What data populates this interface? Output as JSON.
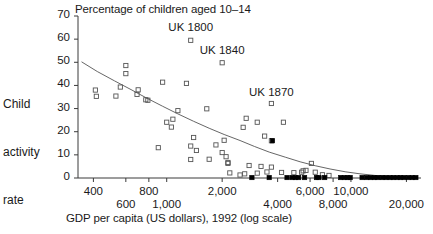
{
  "chart_data": {
    "type": "scatter",
    "title": "Percentage of children aged 10–14",
    "xlabel": "GDP per capita (US dollars), 1992 (log scale)",
    "ylabel": "Child activity rate",
    "ylabel_lines": [
      "Child",
      "activity",
      "rate"
    ],
    "xscale": "log",
    "xlim": [
      330,
      24000
    ],
    "ylim": [
      0,
      70
    ],
    "grid": false,
    "legend": "none",
    "yticks": [
      0,
      10,
      20,
      30,
      40,
      50,
      60,
      70
    ],
    "ytick_labels": [
      "0",
      "10",
      "20",
      "30",
      "40",
      "50",
      "60",
      "70"
    ],
    "xticks": [
      400,
      600,
      800,
      1000,
      2000,
      4000,
      6000,
      8000,
      10000,
      20000
    ],
    "xtick_labels_row1": [
      {
        "value": 400,
        "label": "400"
      },
      {
        "value": 800,
        "label": "800"
      },
      {
        "value": 2000,
        "label": "2,000"
      },
      {
        "value": 6000,
        "label": "6,000"
      },
      {
        "value": 10000,
        "label": "10,000"
      }
    ],
    "xtick_labels_row2": [
      {
        "value": 600,
        "label": "600"
      },
      {
        "value": 1000,
        "label": "1,000"
      },
      {
        "value": 4000,
        "label": "4,000"
      },
      {
        "value": 8000,
        "label": "8,000"
      },
      {
        "value": 20000,
        "label": "20,000"
      }
    ],
    "annotations": [
      {
        "text": "UK 1800",
        "x": 1350,
        "y": 64.5
      },
      {
        "text": "UK 1840",
        "x": 2000,
        "y": 54.5
      },
      {
        "text": "UK 1870",
        "x": 3700,
        "y": 36.5
      }
    ],
    "series": [
      {
        "name": "Developing countries",
        "marker": "open-square",
        "color": "#555555",
        "points": [
          [
            1350,
            59.5
          ],
          [
            2000,
            49.8
          ],
          [
            3700,
            32.2
          ],
          [
            600,
            48.6
          ],
          [
            600,
            45.1
          ],
          [
            560,
            39.3
          ],
          [
            410,
            38.0
          ],
          [
            700,
            38.1
          ],
          [
            415,
            35.3
          ],
          [
            530,
            35.4
          ],
          [
            690,
            36.1
          ],
          [
            770,
            33.8
          ],
          [
            790,
            33.6
          ],
          [
            950,
            41.4
          ],
          [
            1280,
            40.9
          ],
          [
            1150,
            29.1
          ],
          [
            1650,
            29.9
          ],
          [
            1000,
            24.1
          ],
          [
            1080,
            25.4
          ],
          [
            1060,
            22.0
          ],
          [
            2700,
            25.8
          ],
          [
            3100,
            24.1
          ],
          [
            4300,
            24.1
          ],
          [
            3400,
            18.1
          ],
          [
            3700,
            16.1
          ],
          [
            2050,
            16.3
          ],
          [
            2600,
            21.9
          ],
          [
            1400,
            17.5
          ],
          [
            1850,
            14.3
          ],
          [
            1350,
            13.8
          ],
          [
            2000,
            11.0
          ],
          [
            2100,
            9.2
          ],
          [
            2150,
            6.7
          ],
          [
            2150,
            6.3
          ],
          [
            900,
            13.1
          ],
          [
            1450,
            11.9
          ],
          [
            1350,
            8.0
          ],
          [
            1700,
            8.1
          ],
          [
            2200,
            2.2
          ],
          [
            2500,
            1.3
          ],
          [
            2650,
            1.8
          ],
          [
            2800,
            5.4
          ],
          [
            3250,
            5.0
          ],
          [
            3700,
            4.7
          ],
          [
            3100,
            2.1
          ],
          [
            3500,
            2.6
          ],
          [
            4200,
            2.4
          ],
          [
            4900,
            2.3
          ],
          [
            5400,
            2.5
          ],
          [
            5500,
            3.1
          ],
          [
            5700,
            3.3
          ],
          [
            6100,
            6.3
          ],
          [
            6400,
            2.5
          ],
          [
            7000,
            1.4
          ],
          [
            7600,
            1.1
          ]
        ]
      },
      {
        "name": "Industrialized countries",
        "marker": "filled-square",
        "color": "#000000",
        "points": [
          [
            3750,
            16.1
          ],
          [
            2900,
            0.2
          ],
          [
            3600,
            0.2
          ],
          [
            4500,
            0.2
          ],
          [
            4800,
            0.2
          ],
          [
            5000,
            0.2
          ],
          [
            5200,
            0.2
          ],
          [
            5600,
            0.2
          ],
          [
            6500,
            0.2
          ],
          [
            6700,
            0.2
          ],
          [
            7200,
            0.2
          ],
          [
            8800,
            0.2
          ],
          [
            9200,
            0.2
          ],
          [
            9600,
            0.2
          ],
          [
            9900,
            0.2
          ],
          [
            11500,
            0.2
          ],
          [
            12200,
            0.2
          ],
          [
            12800,
            0.2
          ],
          [
            13400,
            0.2
          ],
          [
            14000,
            0.2
          ],
          [
            14800,
            0.2
          ],
          [
            15500,
            0.2
          ],
          [
            16300,
            0.2
          ],
          [
            17000,
            0.2
          ],
          [
            17800,
            0.2
          ],
          [
            18600,
            0.2
          ],
          [
            19400,
            0.2
          ],
          [
            20500,
            0.2
          ],
          [
            21500,
            0.2
          ],
          [
            22500,
            0.2
          ]
        ]
      }
    ],
    "trend_line": {
      "name": "fitted-trend-curve",
      "color": "#555555",
      "points": [
        [
          345,
          50.2
        ],
        [
          420,
          46.0
        ],
        [
          520,
          42.0
        ],
        [
          640,
          38.2
        ],
        [
          780,
          34.5
        ],
        [
          950,
          31.0
        ],
        [
          1150,
          27.7
        ],
        [
          1400,
          24.5
        ],
        [
          1700,
          21.5
        ],
        [
          2050,
          18.8
        ],
        [
          2500,
          16.2
        ],
        [
          3000,
          13.6
        ],
        [
          3600,
          11.2
        ],
        [
          4400,
          9.0
        ],
        [
          5300,
          7.0
        ],
        [
          6400,
          5.3
        ],
        [
          7700,
          3.9
        ],
        [
          9300,
          2.7
        ],
        [
          11200,
          1.8
        ],
        [
          13500,
          1.1
        ],
        [
          16300,
          0.6
        ],
        [
          19600,
          0.3
        ],
        [
          23000,
          0.1
        ]
      ]
    }
  }
}
